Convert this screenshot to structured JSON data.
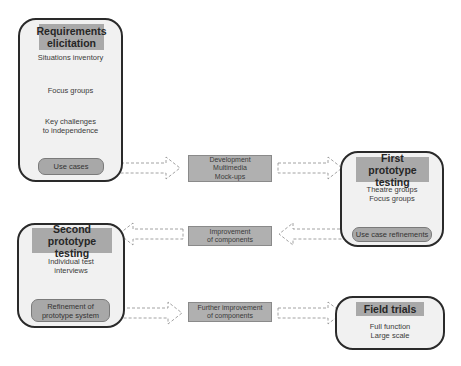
{
  "diagram": {
    "phases": [
      {
        "id": "requirements",
        "title": "Requirements elicitation",
        "title_lines": [
          "Requirements",
          "elicitation"
        ],
        "steps": [
          "Situations inventory",
          "Focus groups",
          "Key challenges to independence"
        ],
        "step_lines": [
          [
            "Situations inventory"
          ],
          [
            "Focus groups"
          ],
          [
            "Key challenges",
            "to independence"
          ]
        ],
        "output": "Use cases"
      },
      {
        "id": "first-prototype",
        "title": "First prototype testing",
        "title_lines": [
          "First prototype",
          "testing"
        ],
        "steps": [
          "Theatre groups",
          "Focus groups"
        ],
        "output": "Use case refinements"
      },
      {
        "id": "second-prototype",
        "title": "Second prototype testing",
        "title_lines": [
          "Second prototype",
          "testing"
        ],
        "steps": [
          "Individual test interviews"
        ],
        "step_lines": [
          "Individual test",
          "interviews"
        ],
        "output": "Refinement of prototype system",
        "output_lines": [
          "Refinement of",
          "prototype system"
        ]
      },
      {
        "id": "field-trials",
        "title": "Field trials",
        "steps": [
          "Full function",
          "Large scale"
        ]
      }
    ],
    "transitions": [
      {
        "from": "Use cases",
        "to": "First prototype testing",
        "label": "Development Multimedia Mock-ups",
        "lines": [
          "Development",
          "Multimedia",
          "Mock-ups"
        ]
      },
      {
        "from": "Use case refinements",
        "to": "Second prototype testing",
        "label": "Improvement of components",
        "lines": [
          "Improvement",
          "of components"
        ]
      },
      {
        "from": "Refinement of prototype system",
        "to": "Field trials",
        "label": "Further improvement of components",
        "lines": [
          "Further improvement",
          "of components"
        ]
      }
    ],
    "colors": {
      "phase_fill": "#f1f1f1",
      "phase_border": "#2a2a2a",
      "title_fill": "#a9a9a9",
      "pill_fill": "#a8a8a8",
      "transition_fill": "#b0b0b0",
      "arrow_fill": "#b5b5b5"
    }
  }
}
